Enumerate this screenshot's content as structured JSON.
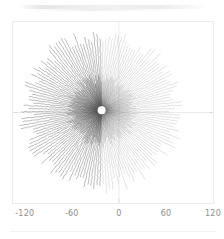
{
  "figure": {
    "background_color": "#ffffff",
    "frame_color": "#ececee",
    "tick_label_color": "#8e8e93",
    "gridline_color": "#e6e6ea",
    "spoke_color": "#555555",
    "center_hole_color": "#ffffff"
  },
  "axis": {
    "x_ticks": [
      {
        "label": "-120",
        "value": -120
      },
      {
        "label": "-60",
        "value": -60
      },
      {
        "label": "0",
        "value": 0
      },
      {
        "label": "60",
        "value": 60
      },
      {
        "label": "120",
        "value": 120
      }
    ],
    "x_min": -135,
    "x_max": 120,
    "y_ticks_visible": false
  },
  "chart_data": {
    "type": "scatter",
    "title": "",
    "subtitle": "",
    "xlabel": "",
    "ylabel": "",
    "xlim": [
      -135,
      120
    ],
    "ylim": [
      -115,
      115
    ],
    "grid": true,
    "gridlines": {
      "x": [
        0
      ],
      "y": [
        0
      ]
    },
    "legend": null,
    "annotations": [],
    "pattern": {
      "kind": "radial-rays",
      "origin": {
        "x": -22,
        "y": 3
      },
      "n_rays": 152,
      "inner_radius": 5,
      "outer_radius_mean": 96,
      "outer_radius_jitter": 10,
      "points_per_ray": 46,
      "core_hole_radius": 4,
      "left_opacity": 0.72,
      "right_opacity": 0.3,
      "angle_offset_deg": 1.2
    },
    "series": [
      {
        "name": "rays",
        "color": "#555555",
        "marker": "point",
        "marker_size": 0.8
      }
    ]
  }
}
